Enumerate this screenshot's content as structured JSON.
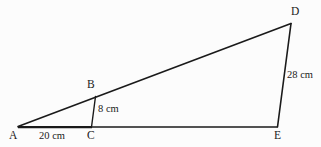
{
  "figure": {
    "background_color": "#fcfcfc",
    "stroke_color": "#1a1a1a",
    "vertices": [
      {
        "id": "A",
        "label": "A",
        "x": 18,
        "y": 127
      },
      {
        "id": "B",
        "label": "B",
        "x": 95,
        "y": 97
      },
      {
        "id": "C",
        "label": "C",
        "x": 92,
        "y": 127
      },
      {
        "id": "D",
        "label": "D",
        "x": 291,
        "y": 23
      },
      {
        "id": "E",
        "label": "E",
        "x": 277,
        "y": 127
      }
    ],
    "segments": [
      {
        "id": "AC",
        "from": "A",
        "to": "C",
        "width": 2.2
      },
      {
        "id": "CE",
        "from": "C",
        "to": "E",
        "width": 1.3
      },
      {
        "id": "AD",
        "from": "A",
        "to": "D",
        "width": 1.6
      },
      {
        "id": "BC",
        "from": "B",
        "to": "C",
        "width": 1.4
      },
      {
        "id": "DE",
        "from": "D",
        "to": "E",
        "width": 1.6
      }
    ],
    "measurements": [
      {
        "id": "AC",
        "segment": "AC",
        "value": "20 cm",
        "number": 20,
        "unit": "cm"
      },
      {
        "id": "BC",
        "segment": "BC",
        "value": "8 cm",
        "number": 8,
        "unit": "cm"
      },
      {
        "id": "DE",
        "segment": "DE",
        "value": "28 cm",
        "number": 28,
        "unit": "cm"
      }
    ]
  }
}
